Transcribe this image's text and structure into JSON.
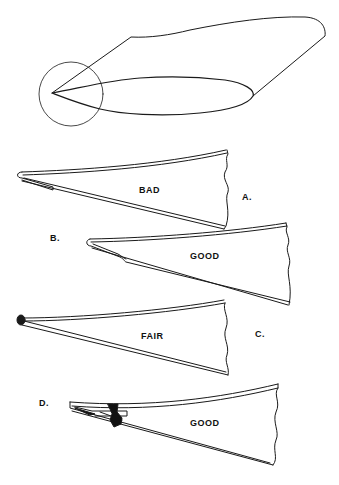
{
  "figure": {
    "overview": {
      "description": "wing-rib-with-trailing-edge-circled"
    },
    "panels": [
      {
        "id": "A",
        "letter": "A.",
        "rating": "BAD"
      },
      {
        "id": "B",
        "letter": "B.",
        "rating": "GOOD"
      },
      {
        "id": "C",
        "letter": "C.",
        "rating": "FAIR"
      },
      {
        "id": "D",
        "letter": "D.",
        "rating": "GOOD"
      }
    ]
  }
}
